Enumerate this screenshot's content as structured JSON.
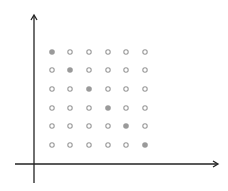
{
  "diagram": {
    "grid": {
      "rows": 6,
      "cols": 6,
      "x_positions": [
        52,
        70,
        89,
        108,
        126,
        145
      ],
      "y_positions": [
        52,
        70,
        89,
        108,
        126,
        145
      ],
      "filled": [
        [
          0,
          0
        ],
        [
          1,
          1
        ],
        [
          2,
          2
        ],
        [
          3,
          3
        ],
        [
          4,
          4
        ],
        [
          5,
          5
        ]
      ]
    },
    "colors": {
      "axis": "#222222",
      "filled_point": "#9a9a9a",
      "hollow_point_stroke": "#9a9a9a",
      "background": "#ffffff"
    },
    "axes": {
      "origin": [
        34,
        164
      ],
      "x_axis": {
        "from": 15,
        "to": 218
      },
      "y_axis": {
        "from": 183,
        "to": 15
      }
    }
  }
}
